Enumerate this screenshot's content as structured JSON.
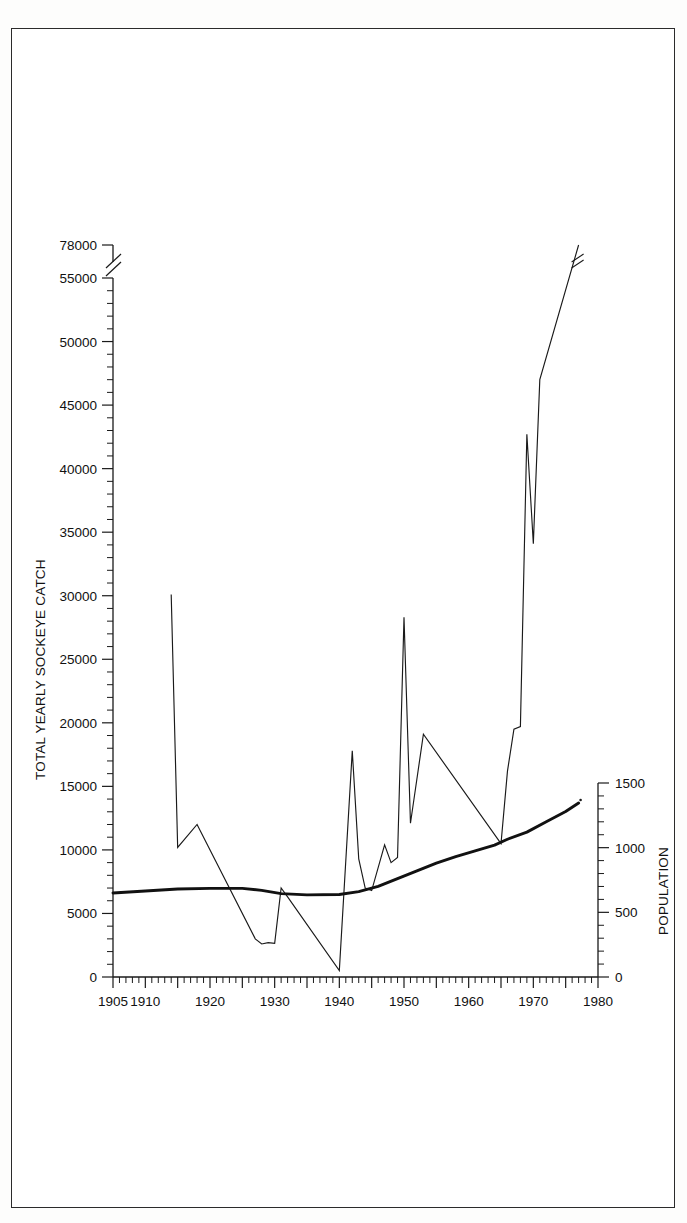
{
  "figure": {
    "background_color": "#ffffff",
    "frame_color": "#2b2b2b",
    "line_color": "#1a1a1a"
  },
  "chart_data": {
    "type": "line",
    "title": "",
    "xlabel": "",
    "grid": false,
    "legend_position": "none",
    "x_axis": {
      "label": "",
      "min": 1905,
      "max": 1980,
      "tick_labels": [
        "1905",
        "1910",
        "1920",
        "1930",
        "1940",
        "1950",
        "1960",
        "1970",
        "1980"
      ],
      "tick_values": [
        1905,
        1910,
        1920,
        1930,
        1940,
        1950,
        1960,
        1970,
        1980
      ],
      "minor_tick_interval": 1
    },
    "y_axis_left": {
      "label": "TOTAL YEARLY SOCKEYE CATCH",
      "min": 0,
      "max": 55000,
      "broken_axis": true,
      "break_between": [
        55000,
        78000
      ],
      "tick_labels": [
        "0",
        "5000",
        "10000",
        "15000",
        "20000",
        "25000",
        "30000",
        "35000",
        "40000",
        "45000",
        "50000",
        "55000",
        "78000"
      ],
      "tick_values": [
        0,
        5000,
        10000,
        15000,
        20000,
        25000,
        30000,
        35000,
        40000,
        45000,
        50000,
        55000,
        78000
      ],
      "minor_tick_interval": 1000
    },
    "y_axis_right": {
      "label": "POPULATION",
      "min": 0,
      "max": 1500,
      "tick_labels": [
        "0",
        "500",
        "1000",
        "1500"
      ],
      "tick_values": [
        0,
        500,
        1000,
        1500
      ],
      "minor_tick_interval": 100
    },
    "series": [
      {
        "name": "Total yearly sockeye catch",
        "axis": "left",
        "style": "thin-line",
        "units": "catch",
        "has_axis_break_marker": true,
        "points": [
          [
            1914,
            30100
          ],
          [
            1915,
            10200
          ],
          [
            1918,
            12000
          ],
          [
            1927,
            3000
          ],
          [
            1928,
            2600
          ],
          [
            1929,
            2700
          ],
          [
            1930,
            2650
          ],
          [
            1931,
            7000
          ],
          [
            1932,
            6300
          ],
          [
            1940,
            500
          ],
          [
            1942,
            17800
          ],
          [
            1943,
            9300
          ],
          [
            1944,
            7000
          ],
          [
            1945,
            6800
          ],
          [
            1947,
            10400
          ],
          [
            1948,
            9000
          ],
          [
            1949,
            9400
          ],
          [
            1950,
            28300
          ],
          [
            1951,
            12100
          ],
          [
            1953,
            19100
          ],
          [
            1965,
            10500
          ],
          [
            1966,
            16200
          ],
          [
            1967,
            19500
          ],
          [
            1968,
            19700
          ],
          [
            1969,
            42700
          ],
          [
            1970,
            34100
          ],
          [
            1971,
            47000
          ],
          [
            1977,
            78000
          ]
        ]
      },
      {
        "name": "Population",
        "axis": "right",
        "style": "thick-line",
        "units": "population",
        "has_axis_break_marker": false,
        "points": [
          [
            1905,
            650
          ],
          [
            1910,
            665
          ],
          [
            1915,
            680
          ],
          [
            1920,
            685
          ],
          [
            1925,
            685
          ],
          [
            1928,
            670
          ],
          [
            1931,
            645
          ],
          [
            1935,
            635
          ],
          [
            1940,
            638
          ],
          [
            1943,
            660
          ],
          [
            1946,
            700
          ],
          [
            1949,
            760
          ],
          [
            1952,
            820
          ],
          [
            1955,
            880
          ],
          [
            1958,
            930
          ],
          [
            1961,
            975
          ],
          [
            1964,
            1020
          ],
          [
            1966,
            1065
          ],
          [
            1969,
            1120
          ],
          [
            1972,
            1200
          ],
          [
            1975,
            1280
          ],
          [
            1977,
            1345
          ]
        ]
      }
    ]
  }
}
